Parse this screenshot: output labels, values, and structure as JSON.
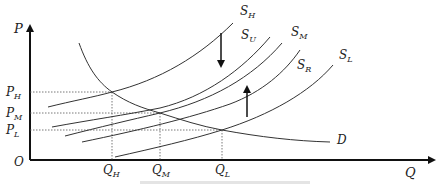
{
  "diagram": {
    "type": "supply-demand",
    "axes": {
      "y_label": "P",
      "x_label": "Q",
      "origin_label": "O"
    },
    "price_levels": [
      {
        "label": "P",
        "sub": "H",
        "y": 92
      },
      {
        "label": "P",
        "sub": "M",
        "y": 113
      },
      {
        "label": "P",
        "sub": "L",
        "y": 130
      }
    ],
    "quantity_levels": [
      {
        "label": "Q",
        "sub": "H",
        "x": 112
      },
      {
        "label": "Q",
        "sub": "M",
        "x": 160
      },
      {
        "label": "Q",
        "sub": "L",
        "x": 222
      }
    ],
    "curves": {
      "demand": {
        "label": "D"
      },
      "supply": [
        {
          "label": "S",
          "sub": "H"
        },
        {
          "label": "S",
          "sub": "U"
        },
        {
          "label": "S",
          "sub": "M"
        },
        {
          "label": "S",
          "sub": "R"
        },
        {
          "label": "S",
          "sub": "L"
        }
      ]
    },
    "shift_arrows": [
      {
        "direction": "down",
        "from": "S_H"
      },
      {
        "direction": "up",
        "from": "S_L"
      }
    ]
  }
}
